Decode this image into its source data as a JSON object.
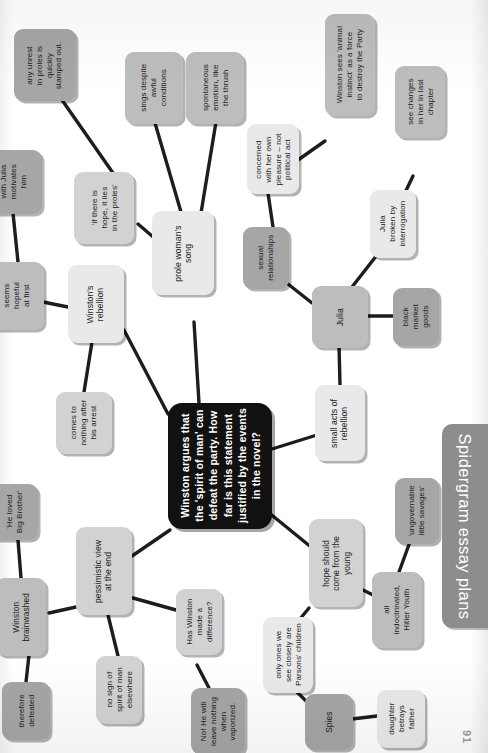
{
  "page": {
    "banner_label": "Spidergram essay plans",
    "page_number": "91",
    "orientation": "text rotated 90 degrees counter-clockwise"
  },
  "central_node": {
    "text": "Winston argues that\nthe 'spirit of man' can\ndefeat the party. How\nfar is this statement\njustified by the events\nin the novel?"
  },
  "nodes": [
    {
      "id": "any-unrest",
      "text": "any unrest\nin proles is\nquickly\nstamped out."
    },
    {
      "id": "if-there-is-hope",
      "text": "'if there is\nhope, it lies\nin the proles'"
    },
    {
      "id": "sings-despite",
      "text": "sings despite\nawful\nconditions"
    },
    {
      "id": "spontaneous-emotion",
      "text": "spontaneous\nemotion, like\nthe thrush"
    },
    {
      "id": "prole-womans-song",
      "text": "prole woman's\nsong"
    },
    {
      "id": "with-julia",
      "text": "with Julia\nmotivates\nhim"
    },
    {
      "id": "seems-hopeful",
      "text": "seems\nhopeful\nat first"
    },
    {
      "id": "winstons-rebellion",
      "text": "Winston's\nrebellion"
    },
    {
      "id": "comes-to-nothing",
      "text": "comes to\nnothing after\nhis arrest"
    },
    {
      "id": "winston-sees-animal",
      "text": "Winston sees 'animal\ninstinct' as a force\nto destroy the Party"
    },
    {
      "id": "see-changes",
      "text": "see changes\nin her in last\nchapter"
    },
    {
      "id": "concerned-pleasure",
      "text": "concerned\nwith her own\npleasure – not\npolitical act"
    },
    {
      "id": "julia-broken",
      "text": "Julia\nbroken by\ninterrogation"
    },
    {
      "id": "sexual-relationships",
      "text": "sexual\nrelationships"
    },
    {
      "id": "julia",
      "text": "Julia"
    },
    {
      "id": "black-market",
      "text": "black\nmarket\ngoods"
    },
    {
      "id": "small-acts",
      "text": "small acts of\nrebellion"
    },
    {
      "id": "he-loved-bb",
      "text": "'He loved\nBig Brother'"
    },
    {
      "id": "winston-brainwashed",
      "text": "Winston\nbrainwashed"
    },
    {
      "id": "therefore-defeated",
      "text": "therefore\ndefeated"
    },
    {
      "id": "pessimistic-view",
      "text": "pessimistic view\nat the end"
    },
    {
      "id": "no-sign-of-spirit",
      "text": "no sign of\nspirit of man\nelsewhere"
    },
    {
      "id": "has-winston-made",
      "text": "Has Winston\nmade a\ndifference?"
    },
    {
      "id": "no-he-will-leave",
      "text": "No! He will\nleave nothing\nwhen\nvaporized."
    },
    {
      "id": "hope-should-come",
      "text": "hope should\ncome from the\nyoung"
    },
    {
      "id": "only-ones-we-see",
      "text": "only ones we\nsee closely are\nParsons' children"
    },
    {
      "id": "spies",
      "text": "Spies"
    },
    {
      "id": "daughter-betrays",
      "text": "daughter\nbetrays\nfather"
    },
    {
      "id": "ungovernable",
      "text": "'ungovernable\nlittle savages'"
    },
    {
      "id": "all-indoctrinated",
      "text": "all\nindoctrinated,\nHitler Youth"
    }
  ],
  "colors": {
    "central_bg": "#111111",
    "central_fg": "#ffffff",
    "banner_bg": "#8d8d8d",
    "banner_fg": "#ffffff",
    "node_tone_a": "#e9e9e9",
    "node_tone_b": "#d2d2d2",
    "node_tone_c": "#bdbdbd",
    "node_tone_d": "#a6a6a6",
    "edge": "#1d1d1d",
    "page_bg": "#ffffff"
  }
}
